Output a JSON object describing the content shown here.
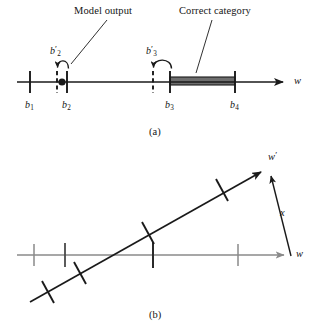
{
  "figure": {
    "panels": [
      {
        "id": "a",
        "caption": "(a)",
        "annotations": [
          {
            "name": "model-output",
            "text": "Model output"
          },
          {
            "name": "correct-category",
            "text": "Correct category"
          }
        ],
        "axis": {
          "name": "w-axis",
          "label": "w",
          "arrow": true
        },
        "boundaries": [
          {
            "name": "b1",
            "base": "b",
            "sub": "1",
            "prime": false,
            "x": 30,
            "style": "solid"
          },
          {
            "name": "b2",
            "base": "b",
            "sub": "2",
            "prime": false,
            "x": 67,
            "style": "solid"
          },
          {
            "name": "b3",
            "base": "b",
            "sub": "3",
            "prime": false,
            "x": 170,
            "style": "solid"
          },
          {
            "name": "b4",
            "base": "b",
            "sub": "4",
            "prime": false,
            "x": 235,
            "style": "solid"
          }
        ],
        "updated_boundaries": [
          {
            "name": "b2-prime",
            "base": "b",
            "sub": "2",
            "prime": true,
            "x": 57,
            "style": "dashed"
          },
          {
            "name": "b3-prime",
            "base": "b",
            "sub": "3",
            "prime": true,
            "x": 153,
            "style": "dashed"
          }
        ],
        "model_output_point": {
          "name": "model-output-dot",
          "x": 62
        },
        "correct_interval": {
          "name": "correct-category-bar",
          "from": 170,
          "to": 235,
          "fill": "#6e6e6e"
        }
      },
      {
        "id": "b",
        "caption": "(b)",
        "axes": [
          {
            "name": "w-axis",
            "label": "w",
            "color": "#8a8a8a"
          },
          {
            "name": "w-prime-axis",
            "label": "w",
            "prime": true,
            "color": "#1a1a1a"
          }
        ],
        "vector": {
          "name": "x-vector",
          "label": "x"
        },
        "w_axis_ticks": [
          34,
          65,
          153,
          238
        ],
        "w_prime_axis_ticks": [
          {
            "x": 48,
            "y": 292
          },
          {
            "x": 80,
            "y": 273
          },
          {
            "x": 148,
            "y": 233
          },
          {
            "x": 222,
            "y": 190
          }
        ]
      }
    ],
    "colors": {
      "ink": "#1a1a1a",
      "gray_axis": "#8a8a8a",
      "bar_fill": "#6e6e6e",
      "background": "#ffffff"
    }
  }
}
